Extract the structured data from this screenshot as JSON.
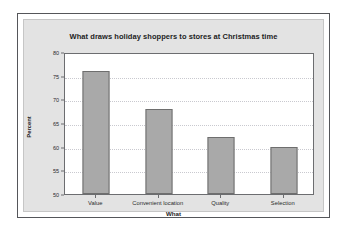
{
  "chart_data": {
    "type": "bar",
    "title": "What draws holiday shoppers to stores at Christmas time",
    "xlabel": "What",
    "ylabel": "Percent",
    "categories": [
      "Value",
      "Convenient location",
      "Quality",
      "Selection"
    ],
    "values": [
      76,
      68,
      62,
      60
    ],
    "ylim": [
      50,
      80
    ],
    "yticks": [
      50,
      55,
      60,
      65,
      70,
      75,
      80
    ],
    "ytick_labels": [
      "50",
      "55",
      "60",
      "65",
      "70",
      "75",
      "80"
    ],
    "grid": "horizontal-dotted",
    "legend": "none",
    "bar_color": "#a9a9a9",
    "bar_edge_color": "#6e6e6e",
    "panel_color": "#e3e3e3",
    "plot_background": "#ffffff",
    "frame_color": "#55565a"
  }
}
